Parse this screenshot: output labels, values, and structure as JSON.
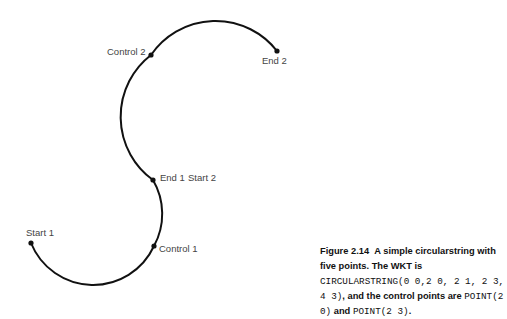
{
  "diagram": {
    "labels": {
      "start1": "Start 1",
      "control1": "Control 1",
      "end1": "End 1",
      "start2": "Start 2",
      "control2": "Control 2",
      "end2": "End 2"
    },
    "points": [
      {
        "name": "Start 1",
        "x": 31,
        "y": 243
      },
      {
        "name": "Control 1",
        "x": 154,
        "y": 246
      },
      {
        "name": "End 1 / Start 2",
        "x": 153,
        "y": 180
      },
      {
        "name": "Control 2",
        "x": 151,
        "y": 55
      },
      {
        "name": "End 2",
        "x": 277,
        "y": 51
      }
    ],
    "stroke_color": "#111111"
  },
  "caption": {
    "figure_number": "Figure 2.14",
    "part1": "A simple circularstring with five points. The WKT is ",
    "wkt": "CIRCULARSTRING(0 0,2 0, 2 1, 2 3, 4 3)",
    "part2": ", and the control points are ",
    "point1": "POINT(2 0)",
    "part3": " and ",
    "point2": "POINT(2 3)",
    "part4": "."
  }
}
